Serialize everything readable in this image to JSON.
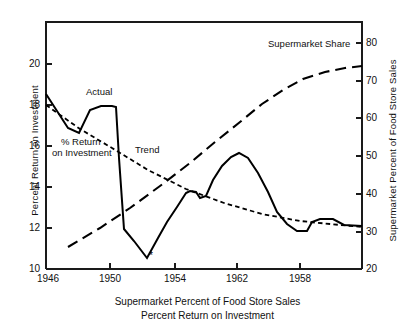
{
  "chart_data": {
    "type": "line",
    "title": "",
    "caption_lines": [
      "Supermarket Percent of Food Store Sales",
      "Percent Return on Investment"
    ],
    "grid": false,
    "legend_position": "inline-annotations",
    "x": {
      "label": "",
      "tick_labels": [
        "1946",
        "1950",
        "1954",
        "1962",
        "1958"
      ],
      "tick_positions_px": [
        46,
        110,
        175,
        237,
        300
      ],
      "range_px": [
        46,
        362
      ]
    },
    "y_left": {
      "label": "Percent Return on Investment",
      "tick_labels": [
        "10",
        "12",
        "14",
        "16",
        "18",
        "20"
      ],
      "ticks": [
        10,
        12,
        14,
        16,
        18,
        20
      ],
      "ylim": [
        10,
        20.5
      ],
      "axis_px": [
        269,
        64
      ]
    },
    "y_right": {
      "label": "Supermarket Percent of Food Store Sales",
      "tick_labels": [
        "20",
        "30",
        "40",
        "50",
        "60",
        "70",
        "80"
      ],
      "ticks": [
        20,
        30,
        40,
        50,
        60,
        70,
        80
      ],
      "ylim": [
        20,
        82
      ],
      "axis_px": [
        269,
        43
      ]
    },
    "series": [
      {
        "name": "Actual",
        "axis": "left",
        "style": "solid",
        "annotation": "Actual",
        "points_px": [
          [
            46,
            94
          ],
          [
            68,
            128
          ],
          [
            79,
            133
          ],
          [
            90,
            110
          ],
          [
            101,
            106
          ],
          [
            112,
            106
          ],
          [
            116,
            107
          ],
          [
            119,
            158
          ],
          [
            124,
            229
          ],
          [
            134,
            241
          ],
          [
            147,
            258
          ],
          [
            158,
            238
          ],
          [
            167,
            222
          ],
          [
            177,
            207
          ],
          [
            186,
            193
          ],
          [
            190,
            191
          ],
          [
            196,
            192
          ],
          [
            200,
            198
          ],
          [
            206,
            196
          ],
          [
            213,
            180
          ],
          [
            222,
            166
          ],
          [
            231,
            157
          ],
          [
            239,
            153
          ],
          [
            248,
            158
          ],
          [
            258,
            173
          ],
          [
            268,
            192
          ],
          [
            277,
            212
          ],
          [
            287,
            224
          ],
          [
            297,
            231
          ],
          [
            307,
            231
          ],
          [
            312,
            222
          ],
          [
            320,
            219
          ],
          [
            333,
            219
          ],
          [
            344,
            225
          ],
          [
            362,
            226
          ]
        ]
      },
      {
        "name": "Trend",
        "axis": "left",
        "style": "short-dash",
        "annotation": "Trend",
        "points_px": [
          [
            46,
            105
          ],
          [
            80,
            129
          ],
          [
            112,
            148
          ],
          [
            148,
            170
          ],
          [
            186,
            189
          ],
          [
            224,
            203
          ],
          [
            262,
            214
          ],
          [
            300,
            221
          ],
          [
            330,
            224
          ],
          [
            362,
            227
          ]
        ]
      },
      {
        "name": "Supermarket Share",
        "axis": "right",
        "style": "long-dash",
        "annotation": "Supermarket Share",
        "points_px": [
          [
            68,
            247
          ],
          [
            100,
            228
          ],
          [
            130,
            208
          ],
          [
            160,
            186
          ],
          [
            190,
            163
          ],
          [
            215,
            142
          ],
          [
            240,
            122
          ],
          [
            262,
            104
          ],
          [
            283,
            90
          ],
          [
            303,
            79
          ],
          [
            325,
            72
          ],
          [
            345,
            68
          ],
          [
            362,
            66
          ]
        ]
      }
    ],
    "markers": [
      {
        "name": "footnote-asterisk",
        "symbol": "*",
        "x_px": 149,
        "y_px": 259
      }
    ],
    "annotations": [
      {
        "name": "actual-label",
        "text": "Actual",
        "x_px": 86,
        "y_px": 92
      },
      {
        "name": "trend-label",
        "text": "Trend",
        "x_px": 135,
        "y_px": 150
      },
      {
        "name": "supermarket-share-label",
        "text": "Supermarket Share",
        "x_px": 268,
        "y_px": 44
      },
      {
        "name": "return-label-line1",
        "text": "% Return",
        "x_px": 61,
        "y_px": 142
      },
      {
        "name": "return-label-line2",
        "text": "on Investment",
        "x_px": 53,
        "y_px": 153
      }
    ],
    "colors": {
      "line": "#000000",
      "axis": "#1a1a1a",
      "text": "#111111",
      "background": "#ffffff"
    }
  }
}
